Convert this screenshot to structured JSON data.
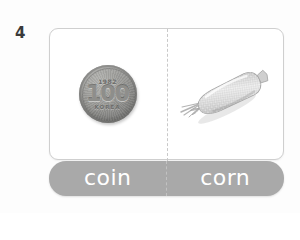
{
  "worksheet": {
    "item_number": "4",
    "background_color": "#fdfdfd"
  },
  "card": {
    "border_color": "#cfcfcf",
    "background_color": "#ffffff",
    "divider_style": "dashed",
    "divider_color": "#c9c9c9",
    "panes": [
      {
        "side": "left",
        "image_name": "coin-image",
        "subject": "coin",
        "coin": {
          "year": "1982",
          "denomination": "100",
          "legend": "KOREA",
          "metal_color": "#9c9c99"
        }
      },
      {
        "side": "right",
        "image_name": "corn-image",
        "subject": "corn",
        "corn": {
          "body_color": "#d6d6d6",
          "husk_color": "#bdbdbd"
        }
      }
    ]
  },
  "label_bar": {
    "background_color": "#a9a9a9",
    "text_color": "#ffffff",
    "labels": [
      {
        "text": "coin"
      },
      {
        "text": "corn"
      }
    ]
  }
}
